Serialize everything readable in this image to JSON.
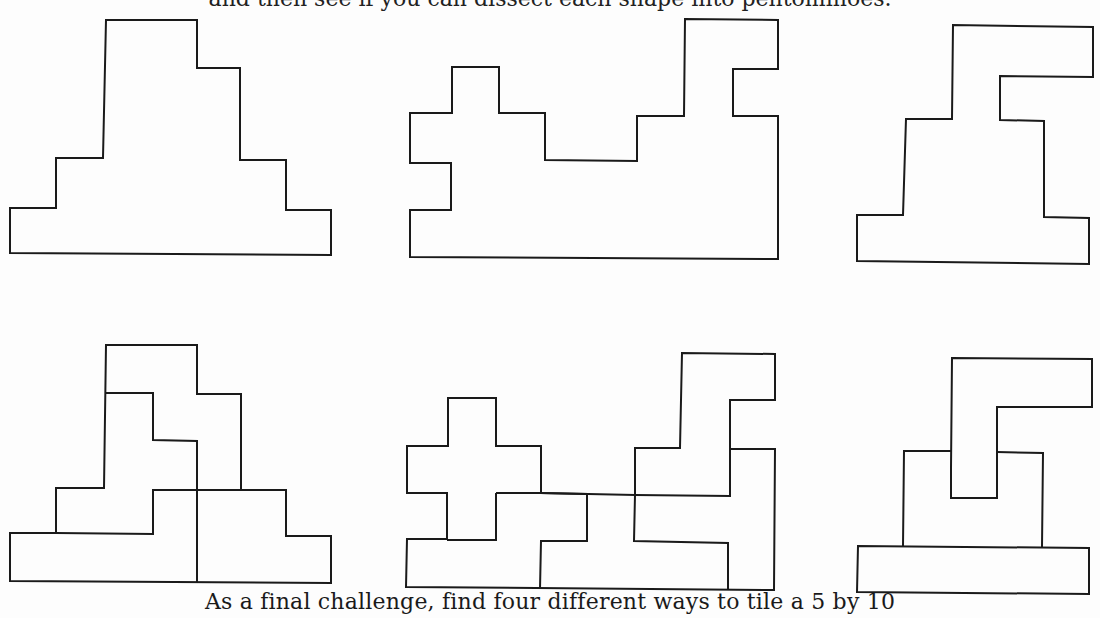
{
  "page": {
    "top_text_fragment": "and then see if you can dissect each shape into pentominoes.",
    "caption": "As a final challenge, find four different ways to tile a 5 by 10"
  },
  "figures": {
    "outlines": [
      {
        "name": "outline-shape-1",
        "description": "stepped pyramid outline"
      },
      {
        "name": "outline-shape-2",
        "description": "wide castle-like outline"
      },
      {
        "name": "outline-shape-3",
        "description": "tall S-shaped outline"
      }
    ],
    "dissections": [
      {
        "name": "dissection-shape-1",
        "pieces": 4
      },
      {
        "name": "dissection-shape-2",
        "pieces": 6
      },
      {
        "name": "dissection-shape-3",
        "pieces": 3
      }
    ]
  },
  "colors": {
    "stroke": "#1a1a1a",
    "background": "#fdfdfd"
  }
}
